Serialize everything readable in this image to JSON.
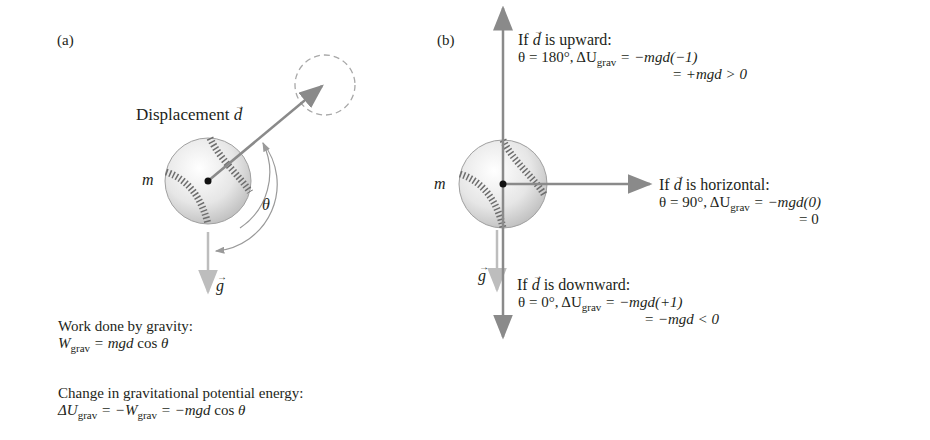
{
  "panel_a": {
    "label": "(a)",
    "displacement_label": "Displacement",
    "vector_d": "d",
    "mass_label": "m",
    "theta": "θ",
    "vector_g": "g",
    "work_heading": "Work done by gravity:",
    "work_lhs": "W",
    "work_sub": "grav",
    "work_rhs_italic": " = mgd",
    "work_rhs_tail": " cos ",
    "work_theta": "θ",
    "pe_heading": "Change in gravitational potential energy:",
    "pe_delta": "ΔU",
    "pe_sub": "grav",
    "pe_mid": " = −W",
    "pe_sub2": "grav",
    "pe_rhs": " = −mgd",
    "pe_tail": " cos ",
    "pe_theta": "θ"
  },
  "panel_b": {
    "label": "(b)",
    "mass_label": "m",
    "vector_g": "g",
    "up": {
      "heading_pre": "If ",
      "d": "d",
      "heading_post": " is upward:",
      "theta_line": "θ = 180°, ΔU",
      "sub": "grav",
      "eq1": " = −mgd(−1)",
      "eq2": "= +mgd > 0"
    },
    "horizontal": {
      "heading_pre": "If ",
      "d": "d",
      "heading_post": " is horizontal:",
      "theta_line": "θ = 90°, ΔU",
      "sub": "grav",
      "eq1": " = −mgd(0)",
      "eq2": "= 0"
    },
    "down": {
      "heading_pre": "If ",
      "d": "d",
      "heading_post": " is downward:",
      "theta_line": "θ = 0°, ΔU",
      "sub": "grav",
      "eq1": " = −mgd(+1)",
      "eq2": "= −mgd < 0"
    }
  },
  "colors": {
    "arrow": "#8a8a8a",
    "gravity_arrow": "#b8b8b8",
    "ball_seam": "#6e6e6e",
    "dashed_circle": "#a8a8a8",
    "text": "#231f20"
  }
}
